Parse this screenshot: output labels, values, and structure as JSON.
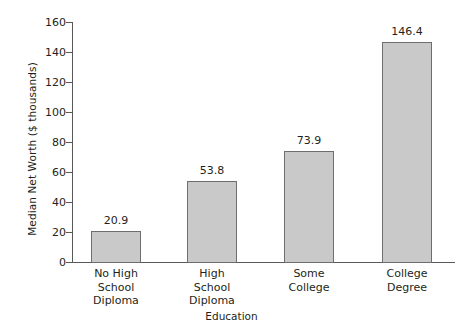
{
  "chart_data": {
    "type": "bar",
    "title": "",
    "xlabel": "Education",
    "ylabel": "Median Net Worth ($ thousands)",
    "categories": [
      "No High School Diploma",
      "High School Diploma",
      "Some College",
      "College Degree"
    ],
    "category_lines": [
      [
        "No High",
        "School",
        "Diploma"
      ],
      [
        "High",
        "School",
        "Diploma"
      ],
      [
        "Some",
        "College"
      ],
      [
        "College",
        "Degree"
      ]
    ],
    "values": [
      20.9,
      53.8,
      73.9,
      146.4
    ],
    "value_labels": [
      "20.9",
      "53.8",
      "73.9",
      "146.4"
    ],
    "ylim": [
      0,
      160
    ],
    "ytick_values": [
      0,
      20,
      40,
      60,
      80,
      100,
      120,
      140,
      160
    ],
    "ytick_labels": [
      "0",
      "20",
      "40",
      "60",
      "80",
      "100",
      "120",
      "140",
      "160"
    ],
    "grid": false,
    "legend": null,
    "bar_color": "#c9c9c9",
    "bar_border_color": "#6d6e70",
    "axis_color": "#58595b",
    "text_color": "#231f20"
  }
}
